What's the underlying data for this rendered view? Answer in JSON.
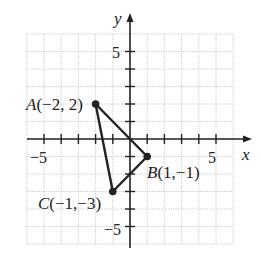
{
  "axes": {
    "x_label": "x",
    "y_label": "y",
    "x_range": [
      -6,
      6
    ],
    "y_range": [
      -6,
      6
    ],
    "tick_labels": {
      "x_neg": "−5",
      "x_pos": "5",
      "y_pos": "5",
      "y_neg": "−5"
    }
  },
  "points": [
    {
      "name": "A",
      "coords": "(−2, 2)",
      "x": -2,
      "y": 2
    },
    {
      "name": "B",
      "coords": "(1,−1)",
      "x": 1,
      "y": -1
    },
    {
      "name": "C",
      "coords": "(−1,−3)",
      "x": -1,
      "y": -3
    }
  ],
  "colors": {
    "grid": "#bdbdbd",
    "axis": "#222222",
    "shape": "#222222"
  }
}
